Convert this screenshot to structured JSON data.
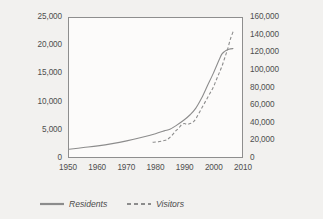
{
  "chart_data": {
    "type": "line",
    "title": "",
    "subtitle": "",
    "xlabel": "",
    "ylabel": "",
    "grid": false,
    "legend_position": "bottom",
    "x": [
      1950,
      1955,
      1960,
      1965,
      1970,
      1975,
      1980,
      1985,
      1990,
      1995,
      2000,
      2005,
      2010
    ],
    "xlim": [
      1950,
      2010
    ],
    "x_ticks": [
      "1950",
      "1960",
      "1970",
      "1980",
      "1990",
      "2000",
      "2010"
    ],
    "x_tick_values": [
      1950,
      1960,
      1970,
      1980,
      1990,
      2000,
      2010
    ],
    "axes": [
      {
        "id": "left",
        "label": "",
        "lim": [
          0,
          25000
        ],
        "ticks": [
          "0",
          "5,000",
          "10,000",
          "15,000",
          "20,000",
          "25,000"
        ],
        "tick_values": [
          0,
          5000,
          10000,
          15000,
          20000,
          25000
        ]
      },
      {
        "id": "right",
        "label": "",
        "lim": [
          0,
          160000
        ],
        "ticks": [
          "0",
          "20,000",
          "40,000",
          "60,000",
          "80,000",
          "100,000",
          "120,000",
          "140,000",
          "160,000"
        ],
        "tick_values": [
          0,
          20000,
          40000,
          60000,
          80000,
          100000,
          120000,
          140000,
          160000
        ]
      }
    ],
    "series": [
      {
        "name": "Residents",
        "axis": "left",
        "style": "solid",
        "color": "#8c8c8c",
        "points": [
          [
            1950,
            1400
          ],
          [
            1955,
            1700
          ],
          [
            1960,
            2000
          ],
          [
            1965,
            2400
          ],
          [
            1970,
            2900
          ],
          [
            1975,
            3500
          ],
          [
            1980,
            4200
          ],
          [
            1983,
            4700
          ],
          [
            1985,
            5000
          ],
          [
            1987,
            5600
          ],
          [
            1990,
            6700
          ],
          [
            1992,
            7600
          ],
          [
            1994,
            8800
          ],
          [
            1996,
            10600
          ],
          [
            1998,
            12800
          ],
          [
            2000,
            15000
          ],
          [
            2002,
            17400
          ],
          [
            2003,
            18500
          ],
          [
            2004,
            19000
          ],
          [
            2005,
            19300
          ],
          [
            2006,
            19450
          ],
          [
            2007,
            19500
          ]
        ]
      },
      {
        "name": "Visitors",
        "axis": "right",
        "style": "dashed",
        "color": "#8c8c8c",
        "points": [
          [
            1979,
            17000
          ],
          [
            1981,
            17500
          ],
          [
            1983,
            19000
          ],
          [
            1984,
            20000
          ],
          [
            1985,
            22500
          ],
          [
            1986,
            26000
          ],
          [
            1987,
            30000
          ],
          [
            1988,
            33000
          ],
          [
            1989,
            37000
          ],
          [
            1990,
            38500
          ],
          [
            1991,
            37500
          ],
          [
            1992,
            38500
          ],
          [
            1993,
            40000
          ],
          [
            1994,
            44000
          ],
          [
            1995,
            50000
          ],
          [
            1996,
            56000
          ],
          [
            1997,
            62000
          ],
          [
            1998,
            68000
          ],
          [
            1999,
            74000
          ],
          [
            2000,
            80000
          ],
          [
            2001,
            88000
          ],
          [
            2002,
            96000
          ],
          [
            2003,
            104000
          ],
          [
            2004,
            114000
          ],
          [
            2005,
            124000
          ],
          [
            2006,
            136000
          ],
          [
            2007,
            145000
          ]
        ]
      }
    ],
    "legend": [
      {
        "label": "Residents",
        "style": "solid",
        "color": "#8c8c8c"
      },
      {
        "label": "Visitors",
        "style": "dashed",
        "color": "#8c8c8c"
      }
    ]
  }
}
